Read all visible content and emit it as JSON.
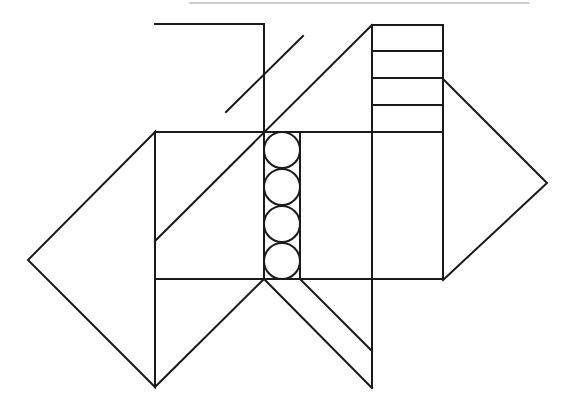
{
  "diagram": {
    "background": "#ffffff",
    "stroke_color": "#1a1a1a",
    "stroke_width": 2,
    "top_rule": {
      "x1": 190,
      "y1": 3,
      "x2": 530,
      "y2": 3,
      "color": "#bdbdbd"
    },
    "top_left_bracket": "155,24 264,24 264,132",
    "short_diagonal": {
      "x1": 226,
      "y1": 112,
      "x2": 303,
      "y2": 36
    },
    "long_diagonal": {
      "x1": 155,
      "y1": 241,
      "x2": 372,
      "y2": 25
    },
    "main_band": {
      "x1": 155,
      "y_top": 132,
      "x2": 443,
      "y_bottom": 279
    },
    "left_triangle": "155,132 28,260 155,387",
    "right_triangle": "443,79 547,183 443,280",
    "ladder": {
      "x": 372,
      "width": 71,
      "rungs": [
        25,
        51,
        78,
        105,
        132
      ]
    },
    "circle_column": {
      "x_left": 264,
      "x_right": 300,
      "cx": 282,
      "r": 18,
      "centers": [
        150,
        187,
        224,
        261
      ]
    },
    "bottom_v": "155,387 264,279 372,388",
    "bottom_stripe": {
      "x1": 300,
      "y1": 279,
      "x2": 372,
      "y2": 351
    },
    "bottom_left_vertical": {
      "x": 155,
      "y1": 279,
      "y2": 387
    },
    "bottom_right_vertical": {
      "x": 372,
      "y1": 279,
      "y2": 388
    }
  }
}
